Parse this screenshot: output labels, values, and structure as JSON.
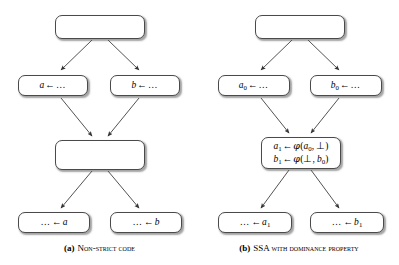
{
  "figure": {
    "background_color": "#ffffff",
    "node_border_color": "#4a4a4a",
    "edge_color": "#333333"
  },
  "panels": [
    {
      "id": "a",
      "caption_tag": "(a)",
      "caption_text": "Non-strict code",
      "nodes": [
        {
          "name": "entry-block",
          "lines": [
            ""
          ]
        },
        {
          "name": "assign-a-block",
          "lines": [
            "a ← …"
          ]
        },
        {
          "name": "assign-b-block",
          "lines": [
            "b ← …"
          ]
        },
        {
          "name": "merge-block",
          "lines": [
            ""
          ]
        },
        {
          "name": "use-a-block",
          "lines": [
            "… ← a"
          ]
        },
        {
          "name": "use-b-block",
          "lines": [
            "… ← b"
          ]
        }
      ],
      "edges": [
        {
          "from": "entry-block",
          "to": "assign-a-block"
        },
        {
          "from": "entry-block",
          "to": "assign-b-block"
        },
        {
          "from": "assign-a-block",
          "to": "merge-block"
        },
        {
          "from": "assign-b-block",
          "to": "merge-block"
        },
        {
          "from": "merge-block",
          "to": "use-a-block"
        },
        {
          "from": "merge-block",
          "to": "use-b-block"
        }
      ]
    },
    {
      "id": "b",
      "caption_tag": "(b)",
      "caption_text": "SSA with dominance property",
      "nodes": [
        {
          "name": "entry-block",
          "lines": [
            ""
          ]
        },
        {
          "name": "assign-a0-block",
          "lines": [
            "a0 ← …"
          ]
        },
        {
          "name": "assign-b0-block",
          "lines": [
            "b0 ← …"
          ]
        },
        {
          "name": "phi-block",
          "lines": [
            "a1 ← φ(a0, ⊥)",
            "b1 ← φ(⊥, b0)"
          ]
        },
        {
          "name": "use-a1-block",
          "lines": [
            "… ← a1"
          ]
        },
        {
          "name": "use-b1-block",
          "lines": [
            "… ← b1"
          ]
        }
      ],
      "edges": [
        {
          "from": "entry-block",
          "to": "assign-a0-block"
        },
        {
          "from": "entry-block",
          "to": "assign-b0-block"
        },
        {
          "from": "assign-a0-block",
          "to": "phi-block"
        },
        {
          "from": "assign-b0-block",
          "to": "phi-block"
        },
        {
          "from": "phi-block",
          "to": "use-a1-block"
        },
        {
          "from": "phi-block",
          "to": "use-b1-block"
        }
      ]
    }
  ],
  "captions": {
    "a_tag": "(a)",
    "a_text": "Non-strict code",
    "b_tag": "(b)",
    "b_text": "SSA with dominance property"
  }
}
